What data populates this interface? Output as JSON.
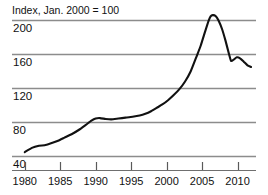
{
  "chart_data": {
    "type": "line",
    "title": "Index, Jan. 2000 = 100",
    "xlabel": "",
    "ylabel": "",
    "xlim": [
      1978.2,
      2012.6
    ],
    "ylim": [
      24,
      212
    ],
    "grid": true,
    "grid_axis": "y",
    "legend": "none",
    "yticks": [
      40,
      80,
      120,
      160,
      200
    ],
    "ytick_labels": [
      "40",
      "80",
      "120",
      "160",
      "200"
    ],
    "ytick_label_position": "below-gridline-inside",
    "xticks": [
      1980,
      1985,
      1990,
      1995,
      2000,
      2005,
      2010
    ],
    "xtick_labels": [
      "1980",
      "1985",
      "1990",
      "1995",
      "2000",
      "2005",
      "2010"
    ],
    "series": [
      {
        "name": "Index",
        "color": "#111111",
        "x": [
          1980.0,
          1981.0,
          1982.0,
          1982.8,
          1983.6,
          1984.6,
          1985.6,
          1986.6,
          1987.6,
          1988.6,
          1989.4,
          1990.0,
          1990.6,
          1991.4,
          1992.2,
          1993.2,
          1994.2,
          1995.2,
          1996.2,
          1997.0,
          1997.8,
          1998.6,
          1999.4,
          2000.2,
          2001.0,
          2001.8,
          2002.6,
          2003.4,
          2004.2,
          2004.8,
          2005.4,
          2005.9,
          2006.2,
          2006.5,
          2006.9,
          2007.3,
          2007.8,
          2008.3,
          2008.8,
          2009.1,
          2009.5,
          2009.9,
          2010.4,
          2010.9,
          2011.4,
          2011.9
        ],
        "y": [
          45.0,
          50.0,
          52.5,
          53.0,
          55.0,
          58.0,
          62.0,
          66.0,
          71.0,
          77.0,
          82.0,
          84.5,
          85.0,
          84.0,
          83.5,
          84.5,
          85.5,
          86.5,
          88.0,
          90.0,
          93.0,
          97.0,
          101.0,
          106.0,
          112.0,
          119.0,
          128.0,
          140.0,
          157.0,
          170.0,
          186.0,
          199.0,
          204.5,
          206.0,
          205.0,
          200.0,
          190.0,
          176.0,
          160.0,
          152.0,
          154.0,
          156.5,
          155.0,
          151.0,
          147.0,
          145.0
        ]
      }
    ]
  },
  "axes": {
    "y_tick_values": [
      "200",
      "160",
      "120",
      "80",
      "40"
    ],
    "x_tick_values": [
      "1980",
      "1985",
      "1990",
      "1995",
      "2000",
      "2005",
      "2010"
    ]
  },
  "colors": {
    "line": "#111111",
    "grid": "#8c8c8c",
    "axis": "#6f6f6f",
    "background": "#ffffff",
    "text": "#111111"
  }
}
